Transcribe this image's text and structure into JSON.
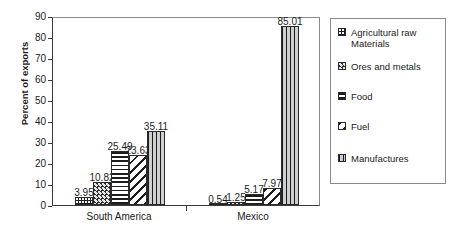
{
  "chart_data": {
    "type": "bar",
    "title": "",
    "xlabel": "",
    "ylabel": "Percent of exports",
    "ylim": [
      0,
      90
    ],
    "ytick_labels": [
      "0",
      "10",
      "20",
      "30",
      "40",
      "50",
      "60",
      "70",
      "80",
      "90"
    ],
    "ytick_values": [
      0,
      10,
      20,
      30,
      40,
      50,
      60,
      70,
      80,
      90
    ],
    "grid": false,
    "legend_position": "right",
    "categories": [
      "South America",
      "Mexico"
    ],
    "series": [
      {
        "name": "Agricultural raw\nMaterials",
        "pattern": "dotted-dark",
        "values": [
          3.95,
          0.54
        ],
        "labels": [
          "3.95",
          "0.54"
        ]
      },
      {
        "name": "Ores and metals",
        "pattern": "dense-dots-dark",
        "values": [
          10.82,
          1.25
        ],
        "labels": [
          "10.82",
          "1.25"
        ]
      },
      {
        "name": "Food",
        "pattern": "horizontal-lines",
        "values": [
          25.49,
          5.17
        ],
        "labels": [
          "25.49",
          "5.17"
        ]
      },
      {
        "name": "Fuel",
        "pattern": "diagonal-stripes",
        "values": [
          23.63,
          7.97
        ],
        "labels": [
          "23.63",
          "7.97"
        ]
      },
      {
        "name": "Manufactures",
        "pattern": "vertical-lines",
        "values": [
          35.11,
          85.01
        ],
        "labels": [
          "35.11",
          "85.01"
        ]
      }
    ]
  },
  "axis": {
    "y_title": "Percent of exports"
  },
  "legend": {
    "items": [
      {
        "label": "Agricultural raw\nMaterials"
      },
      {
        "label": "Ores and metals"
      },
      {
        "label": "Food"
      },
      {
        "label": "Fuel"
      },
      {
        "label": "Manufactures"
      }
    ]
  }
}
